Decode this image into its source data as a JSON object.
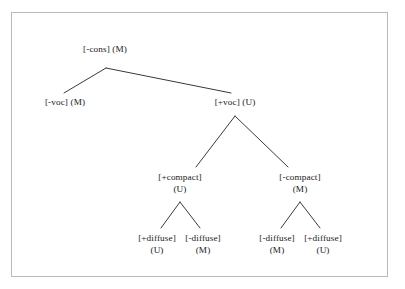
{
  "figure": {
    "type": "binary-feature-tree",
    "background_color": "#ffffff",
    "border_color": "#b9b9b9",
    "line_color": "#3a3a3a",
    "text_color": "#1a1a1a"
  },
  "tree": {
    "nodes": [
      {
        "id": "root",
        "feature": "[-cons]",
        "marked": "(M)",
        "layout": "inline",
        "x": 105,
        "y": 44
      },
      {
        "id": "voc-minus",
        "feature": "[-voc]",
        "marked": "(M)",
        "layout": "inline",
        "x": 65,
        "y": 97
      },
      {
        "id": "voc-plus",
        "feature": "[+voc]",
        "marked": "(U)",
        "layout": "inline",
        "x": 235,
        "y": 97
      },
      {
        "id": "compact-plus",
        "feature": "[+compact]",
        "marked": "(U)",
        "layout": "stacked",
        "x": 180,
        "y": 172
      },
      {
        "id": "compact-minus",
        "feature": "[-compact]",
        "marked": "(M)",
        "layout": "stacked",
        "x": 300,
        "y": 172
      },
      {
        "id": "diffuse-plus-left",
        "feature": "[+diffuse]",
        "marked": "(U)",
        "layout": "stacked",
        "x": 157,
        "y": 233
      },
      {
        "id": "diffuse-minus-left",
        "feature": "[-diffuse]",
        "marked": "(M)",
        "layout": "stacked",
        "x": 203,
        "y": 233
      },
      {
        "id": "diffuse-minus-right",
        "feature": "[-diffuse]",
        "marked": "(M)",
        "layout": "stacked",
        "x": 277,
        "y": 233
      },
      {
        "id": "diffuse-plus-right",
        "feature": "[+diffuse]",
        "marked": "(U)",
        "layout": "stacked",
        "x": 323,
        "y": 233
      }
    ],
    "edges": [
      {
        "id": "root-to-voc-minus",
        "from": "root",
        "to": "voc-minus",
        "x1": 106,
        "y1": 68,
        "x2": 64,
        "y2": 93
      },
      {
        "id": "root-to-voc-plus",
        "from": "root",
        "to": "voc-plus",
        "x1": 106,
        "y1": 68,
        "x2": 231,
        "y2": 93
      },
      {
        "id": "voc-to-compact-plus",
        "from": "voc-plus",
        "to": "compact-plus",
        "x1": 235,
        "y1": 116,
        "x2": 196,
        "y2": 167
      },
      {
        "id": "voc-to-compact-minus",
        "from": "voc-plus",
        "to": "compact-minus",
        "x1": 235,
        "y1": 116,
        "x2": 288,
        "y2": 167
      },
      {
        "id": "cp-to-diffuse-plus",
        "from": "compact-plus",
        "to": "diffuse-plus-left",
        "x1": 180,
        "y1": 202,
        "x2": 161,
        "y2": 228
      },
      {
        "id": "cp-to-diffuse-minus",
        "from": "compact-plus",
        "to": "diffuse-minus-left",
        "x1": 180,
        "y1": 202,
        "x2": 200,
        "y2": 228
      },
      {
        "id": "cm-to-diffuse-minus",
        "from": "compact-minus",
        "to": "diffuse-minus-right",
        "x1": 300,
        "y1": 202,
        "x2": 281,
        "y2": 228
      },
      {
        "id": "cm-to-diffuse-plus",
        "from": "compact-minus",
        "to": "diffuse-plus-right",
        "x1": 300,
        "y1": 202,
        "x2": 320,
        "y2": 228
      }
    ]
  }
}
